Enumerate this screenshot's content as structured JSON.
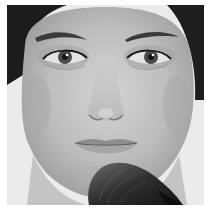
{
  "image": {
    "description": "Grayscale close-up portrait of a woman's face with a makeup powder brush touching her chin",
    "style": "black and white photograph",
    "colors": {
      "background": "#ffffff",
      "backdrop": "#ebebeb",
      "skin_light": "#d2d2d2",
      "skin_mid": "#b4b4b4",
      "skin_shadow": "#8c8c8c",
      "hair": "#1c1c1c",
      "brush": "#2e2e2e",
      "iris": "#4a4a4a"
    },
    "subjects": [
      {
        "name": "face",
        "details": [
          "dark hair framing forehead",
          "two eyes with eyeliner",
          "eyebrows",
          "nose",
          "closed lips"
        ]
      },
      {
        "name": "makeup-brush",
        "details": [
          "dark bristles",
          "touching chin from lower right"
        ]
      }
    ]
  }
}
